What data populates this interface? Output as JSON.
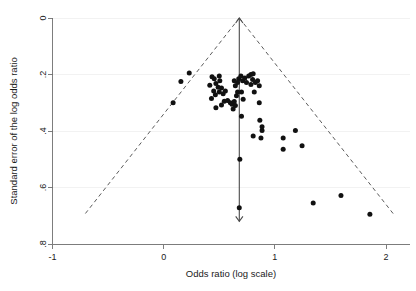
{
  "chart_data": {
    "type": "scatter",
    "title": "",
    "xlabel": "Odds ratio (log scale)",
    "ylabel": "Standard error of the log odds ratio",
    "xlim": [
      -1.1,
      2.1
    ],
    "ylim": [
      0,
      0.82
    ],
    "y_inverted": true,
    "grid": "horizontal-light",
    "legend": "none",
    "xticks": [
      -1,
      0,
      1,
      2
    ],
    "xtick_labels": [
      "-1",
      "0",
      "1",
      "2"
    ],
    "yticks": [
      0,
      0.2,
      0.4,
      0.6,
      0.8
    ],
    "ytick_labels": [
      "0",
      ".2",
      ".4",
      ".6",
      ".8"
    ],
    "annotations": {
      "reference_line_x": 0.68,
      "reference_line_y_from": 0.0,
      "reference_line_y_to": 0.72,
      "funnel_apex": [
        0.68,
        0.0
      ],
      "funnel_left_base": [
        -0.72,
        0.7
      ],
      "funnel_right_base": [
        2.08,
        0.7
      ]
    },
    "points": [
      {
        "x": 0.23,
        "y": 0.195
      },
      {
        "x": 0.155,
        "y": 0.225
      },
      {
        "x": 0.085,
        "y": 0.3
      },
      {
        "x": 0.435,
        "y": 0.208
      },
      {
        "x": 0.455,
        "y": 0.215
      },
      {
        "x": 0.47,
        "y": 0.232
      },
      {
        "x": 0.415,
        "y": 0.238
      },
      {
        "x": 0.5,
        "y": 0.205
      },
      {
        "x": 0.505,
        "y": 0.222
      },
      {
        "x": 0.49,
        "y": 0.245
      },
      {
        "x": 0.45,
        "y": 0.258
      },
      {
        "x": 0.465,
        "y": 0.272
      },
      {
        "x": 0.43,
        "y": 0.285
      },
      {
        "x": 0.5,
        "y": 0.262
      },
      {
        "x": 0.52,
        "y": 0.248
      },
      {
        "x": 0.535,
        "y": 0.268
      },
      {
        "x": 0.555,
        "y": 0.258
      },
      {
        "x": 0.47,
        "y": 0.318
      },
      {
        "x": 0.52,
        "y": 0.308
      },
      {
        "x": 0.545,
        "y": 0.295
      },
      {
        "x": 0.575,
        "y": 0.292
      },
      {
        "x": 0.6,
        "y": 0.3
      },
      {
        "x": 0.615,
        "y": 0.305
      },
      {
        "x": 0.635,
        "y": 0.296
      },
      {
        "x": 0.645,
        "y": 0.31
      },
      {
        "x": 0.625,
        "y": 0.322
      },
      {
        "x": 0.655,
        "y": 0.275
      },
      {
        "x": 0.665,
        "y": 0.262
      },
      {
        "x": 0.645,
        "y": 0.24
      },
      {
        "x": 0.665,
        "y": 0.228
      },
      {
        "x": 0.635,
        "y": 0.222
      },
      {
        "x": 0.675,
        "y": 0.215
      },
      {
        "x": 0.695,
        "y": 0.205
      },
      {
        "x": 0.71,
        "y": 0.222
      },
      {
        "x": 0.73,
        "y": 0.212
      },
      {
        "x": 0.745,
        "y": 0.228
      },
      {
        "x": 0.765,
        "y": 0.205
      },
      {
        "x": 0.785,
        "y": 0.2
      },
      {
        "x": 0.805,
        "y": 0.197
      },
      {
        "x": 0.8,
        "y": 0.218
      },
      {
        "x": 0.785,
        "y": 0.235
      },
      {
        "x": 0.825,
        "y": 0.228
      },
      {
        "x": 0.845,
        "y": 0.222
      },
      {
        "x": 0.86,
        "y": 0.24
      },
      {
        "x": 0.815,
        "y": 0.262
      },
      {
        "x": 0.7,
        "y": 0.262
      },
      {
        "x": 0.715,
        "y": 0.288
      },
      {
        "x": 0.86,
        "y": 0.3
      },
      {
        "x": 0.7,
        "y": 0.348
      },
      {
        "x": 0.865,
        "y": 0.362
      },
      {
        "x": 0.885,
        "y": 0.385
      },
      {
        "x": 0.885,
        "y": 0.398
      },
      {
        "x": 0.805,
        "y": 0.418
      },
      {
        "x": 0.875,
        "y": 0.425
      },
      {
        "x": 0.68,
        "y": 0.672
      },
      {
        "x": 0.685,
        "y": 0.5
      },
      {
        "x": 1.075,
        "y": 0.425
      },
      {
        "x": 1.075,
        "y": 0.465
      },
      {
        "x": 1.185,
        "y": 0.398
      },
      {
        "x": 1.245,
        "y": 0.452
      },
      {
        "x": 1.345,
        "y": 0.655
      },
      {
        "x": 1.595,
        "y": 0.628
      },
      {
        "x": 1.855,
        "y": 0.695
      }
    ]
  },
  "axes": {
    "x_title": "Odds ratio (log scale)",
    "y_title": "Standard error of the log odds ratio"
  }
}
